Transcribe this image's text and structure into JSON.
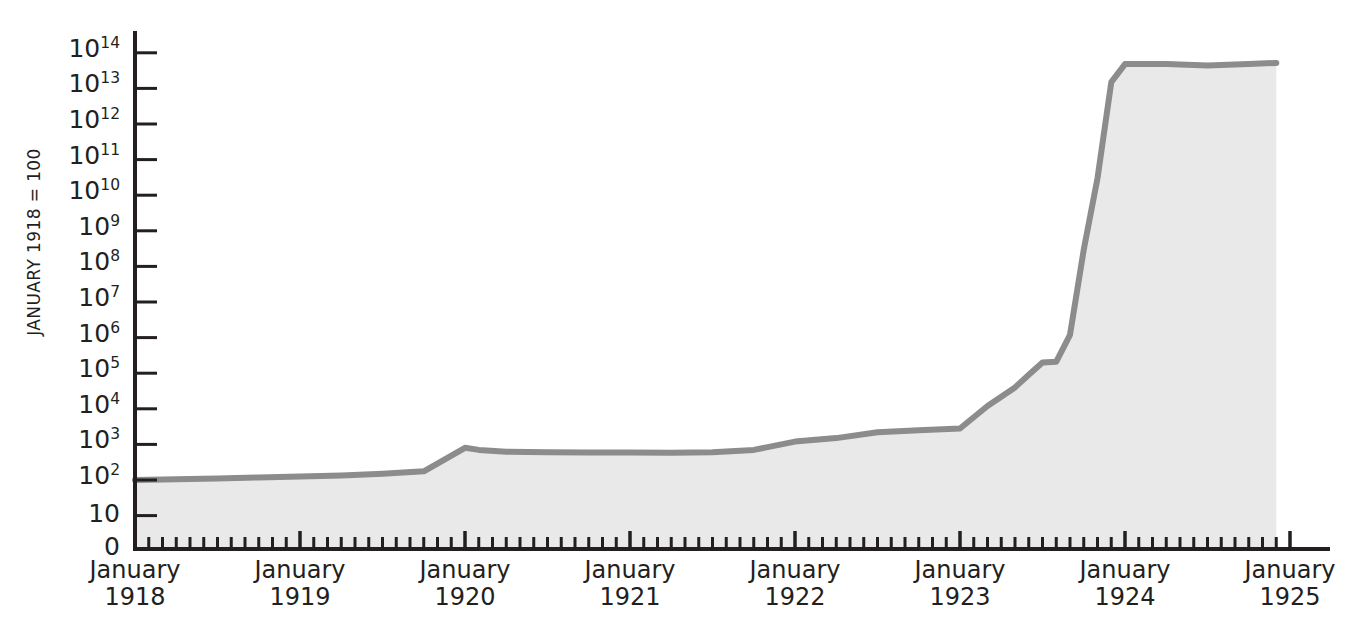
{
  "chart_data": {
    "type": "area",
    "title": "",
    "subtitle": "",
    "xlabel": "",
    "ylabel": "JANUARY 1918 = 100",
    "x_tick_labels": [
      {
        "month": "January",
        "year": "1918"
      },
      {
        "month": "January",
        "year": "1919"
      },
      {
        "month": "January",
        "year": "1920"
      },
      {
        "month": "January",
        "year": "1921"
      },
      {
        "month": "January",
        "year": "1922"
      },
      {
        "month": "January",
        "year": "1923"
      },
      {
        "month": "January",
        "year": "1924"
      },
      {
        "month": "January",
        "year": "1925"
      }
    ],
    "y_tick_labels": [
      "0",
      "10",
      "10^2",
      "10^3",
      "10^4",
      "10^5",
      "10^6",
      "10^7",
      "10^8",
      "10^9",
      "10^10",
      "10^11",
      "10^12",
      "10^13",
      "10^14"
    ],
    "y_scale": "log",
    "ylim_exponent": [
      1,
      14
    ],
    "xlim": [
      "1918-01",
      "1925-01"
    ],
    "grid": false,
    "legend": null,
    "minor_ticks": "monthly",
    "series": [
      {
        "name": "Price index (January 1918 = 100)",
        "line_color": "#8c8c8c",
        "fill_color": "#e9e9e9",
        "x": [
          "1918-01",
          "1918-04",
          "1918-07",
          "1918-10",
          "1919-01",
          "1919-04",
          "1919-07",
          "1919-10",
          "1920-01",
          "1920-02",
          "1920-04",
          "1920-07",
          "1920-10",
          "1921-01",
          "1921-04",
          "1921-07",
          "1921-10",
          "1922-01",
          "1922-04",
          "1922-07",
          "1922-10",
          "1923-01",
          "1923-03",
          "1923-05",
          "1923-06",
          "1923-07",
          "1923-08",
          "1923-09",
          "1923-10",
          "1923-11",
          "1923-12",
          "1924-01",
          "1924-04",
          "1924-07",
          "1924-10",
          "1924-12"
        ],
        "values": [
          100,
          105,
          110,
          118,
          125,
          135,
          150,
          175,
          800,
          700,
          620,
          600,
          595,
          590,
          580,
          600,
          700,
          1200,
          1500,
          2200,
          2500,
          2800,
          12000,
          40000,
          90000,
          200000,
          210000,
          1200000,
          300000000,
          30000000000,
          15000000000000,
          48000000000000,
          48000000000000,
          44000000000000,
          48000000000000,
          52000000000000
        ]
      }
    ]
  },
  "geometry": {
    "plot_left": 135,
    "plot_right": 1290,
    "baseline_y": 549,
    "decade_px": 35.6,
    "y_at_1e2": 480
  }
}
